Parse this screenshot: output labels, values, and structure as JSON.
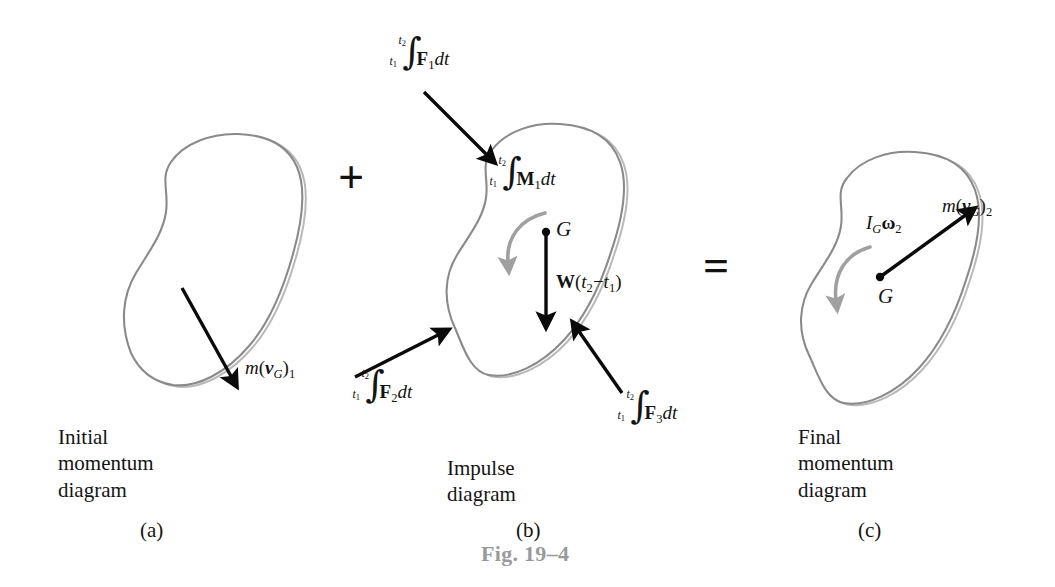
{
  "figure": {
    "number_label": "Fig. 19–4",
    "equation_operators": {
      "plus": "+",
      "equals": "="
    }
  },
  "panels": [
    {
      "id": "a",
      "caption": "Initial\nmomentum\ndiagram",
      "sublabel": "(a)",
      "annotations": [
        {
          "name": "linear-momentum-initial",
          "type": "vector",
          "text_parts": {
            "m": "m",
            "paren_open": "(",
            "vector": "v",
            "sub_vector": "G",
            "paren_close": ")",
            "sub_index": "1"
          },
          "plain": "m(v_G)_1",
          "direction": "down-right"
        }
      ]
    },
    {
      "id": "b",
      "caption": "Impulse\ndiagram",
      "sublabel": "(b)",
      "annotations": [
        {
          "name": "force-impulse-1",
          "type": "integral",
          "lower_limit": "t",
          "lower_index": "1",
          "upper_limit": "t",
          "upper_index": "2",
          "integrand_bold": "F",
          "integrand_index": "1",
          "differential": "dt",
          "plain": "∫ F_1 dt",
          "direction": "down-right"
        },
        {
          "name": "moment-impulse-1",
          "type": "integral",
          "lower_limit": "t",
          "lower_index": "1",
          "upper_limit": "t",
          "upper_index": "2",
          "integrand_bold": "M",
          "integrand_index": "1",
          "differential": "dt",
          "plain": "∫ M_1 dt",
          "direction": "clockwise-arc"
        },
        {
          "name": "weight-impulse",
          "type": "vector",
          "text_parts": {
            "bold": "W",
            "paren_open": "(",
            "t2": "t",
            "sub_2": "2",
            "minus": "−",
            "t1": "t",
            "sub_1": "1",
            "paren_close": ")"
          },
          "plain": "W(t_2 − t_1)",
          "direction": "down"
        },
        {
          "name": "force-impulse-2",
          "type": "integral",
          "lower_limit": "t",
          "lower_index": "1",
          "upper_limit": "t",
          "upper_index": "2",
          "integrand_bold": "F",
          "integrand_index": "2",
          "differential": "dt",
          "plain": "∫ F_2 dt",
          "direction": "up-right"
        },
        {
          "name": "force-impulse-3",
          "type": "integral",
          "lower_limit": "t",
          "lower_index": "1",
          "upper_limit": "t",
          "upper_index": "2",
          "integrand_bold": "F",
          "integrand_index": "3",
          "differential": "dt",
          "plain": "∫ F_3 dt",
          "direction": "up-left"
        },
        {
          "name": "center-of-mass-point",
          "type": "point-label",
          "plain": "G"
        }
      ]
    },
    {
      "id": "c",
      "caption": "Final\nmomentum\ndiagram",
      "sublabel": "(c)",
      "annotations": [
        {
          "name": "angular-momentum-final",
          "type": "moment",
          "text_parts": {
            "I": "I",
            "sub_I": "G",
            "omega": "ω",
            "sub_omega": "2"
          },
          "plain": "I_G ω_2",
          "direction": "clockwise-arc"
        },
        {
          "name": "linear-momentum-final",
          "type": "vector",
          "text_parts": {
            "m": "m",
            "paren_open": "(",
            "vector": "v",
            "sub_vector": "G",
            "paren_close": ")",
            "sub_index": "2"
          },
          "plain": "m(v_G)_2",
          "direction": "up-right"
        },
        {
          "name": "center-of-mass-point",
          "type": "point-label",
          "plain": "G"
        }
      ]
    }
  ],
  "labels": {
    "G": "G",
    "m": "m",
    "v": "v",
    "W": "W",
    "F": "F",
    "M": "M",
    "I": "I",
    "omega": "ω",
    "dt": "dt",
    "t": "t",
    "one": "1",
    "two": "2",
    "three": "3",
    "minus": "−",
    "paren_open": "(",
    "paren_close": ")"
  },
  "colors": {
    "outline": "#8a8a8a",
    "outline_shadow": "#b9b9b9",
    "vector": "#0a0a0a",
    "moment_arc": "#a0a0a0",
    "text": "#141414",
    "figure_number": "#9a9a9a",
    "background": "#ffffff"
  }
}
